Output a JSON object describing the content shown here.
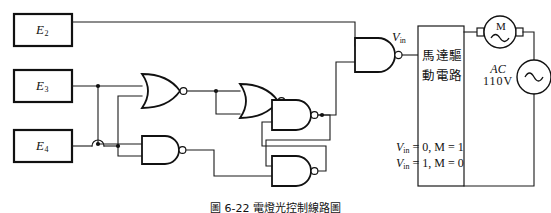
{
  "figure": {
    "caption": "圖 6-22 電燈光控制線路圖",
    "inputs": [
      {
        "name": "input-box-e2",
        "label": "E",
        "sub": "2"
      },
      {
        "name": "input-box-e3",
        "label": "E",
        "sub": "3"
      },
      {
        "name": "input-box-e4",
        "label": "E",
        "sub": "4"
      }
    ],
    "gates": [
      {
        "name": "nor-gate-1",
        "type": "NOR"
      },
      {
        "name": "nor-gate-2",
        "type": "NOR"
      },
      {
        "name": "nand-gate-lower-input",
        "type": "NAND"
      },
      {
        "name": "nand-latch-upper",
        "type": "NAND"
      },
      {
        "name": "nand-latch-lower",
        "type": "NAND"
      },
      {
        "name": "nand-gate-output",
        "type": "NAND"
      }
    ],
    "signal": {
      "label": "V",
      "sub": "in"
    },
    "driver_box": {
      "line1": "馬達驅",
      "line2": "動電路"
    },
    "motor": {
      "symbol": "M"
    },
    "source": {
      "type": "AC",
      "voltage": "110V"
    },
    "truth_rows": [
      {
        "vin_label": "V",
        "vin_sub": "in",
        "vin_value": "0",
        "sep": ",",
        "m_label": "M",
        "m_value": "1"
      },
      {
        "vin_label": "V",
        "vin_sub": "in",
        "vin_value": "1",
        "sep": ",",
        "m_label": "M",
        "m_value": "0"
      }
    ],
    "colors": {
      "wire": "#1a1a1a",
      "outline": "#111111",
      "background": "#ffffff"
    }
  }
}
